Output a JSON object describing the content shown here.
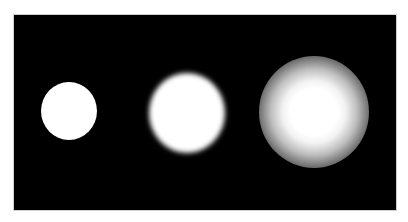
{
  "image": {
    "description": "Three white discs on a black background showing increasing blur from left to right",
    "background_color": "#000000",
    "frame_border_color": "#cfcfcf",
    "page_background": "#ffffff",
    "discs": [
      {
        "label": "sharp",
        "color": "#ffffff",
        "center": [
          68,
          110
        ],
        "radius": 28,
        "blur": "none"
      },
      {
        "label": "slightly-blurred",
        "color": "#ffffff",
        "center": [
          186,
          112
        ],
        "radius": 39,
        "blur": "low"
      },
      {
        "label": "heavily-blurred",
        "color": "#ffffff",
        "center": [
          313,
          111
        ],
        "radius": 55,
        "blur": "high"
      }
    ]
  }
}
